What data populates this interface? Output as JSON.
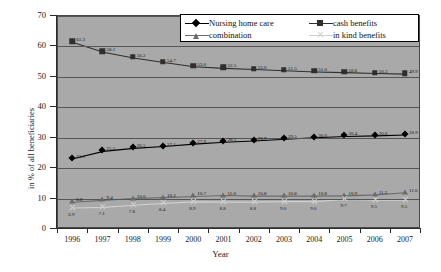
{
  "chart_data": {
    "type": "line",
    "title": "",
    "xlabel": "Year",
    "ylabel": "in % of all beneficiaries",
    "categories": [
      "1996",
      "1997",
      "1998",
      "1999",
      "2000",
      "2001",
      "2002",
      "2003",
      "2004",
      "2005",
      "2006",
      "2007"
    ],
    "ylim": [
      0,
      70
    ],
    "ytick_labels": [
      "0",
      "10",
      "20",
      "30",
      "40",
      "50",
      "60",
      "70"
    ],
    "grid": true,
    "legend_position": "top-center",
    "series": [
      {
        "name": "Nursing home care",
        "marker": "diamond",
        "color": "#000000",
        "values": [
          23.1,
          25.5,
          26.5,
          27.1,
          27.9,
          28.5,
          28.9,
          29.5,
          30.0,
          30.4,
          30.6,
          30.9
        ],
        "labels": [
          "23.1",
          "25.5",
          "26.5",
          "27.1",
          "27.9",
          "28.5",
          "28.9",
          "29.5",
          "30.0",
          "30.4",
          "30.6",
          "30.9"
        ]
      },
      {
        "name": "cash benefits",
        "marker": "square",
        "color": "#2f2f2f",
        "values": [
          61.3,
          58.1,
          56.2,
          54.7,
          53.3,
          52.8,
          52.4,
          52.0,
          51.6,
          51.4,
          51.1,
          50.9
        ],
        "labels": [
          "61.3",
          "58.1",
          "56.2",
          "54.7",
          "53.0",
          "52.5",
          "52.0",
          "51.5",
          "51.0",
          "50.6",
          "50.3",
          "49.9"
        ]
      },
      {
        "name": "combination",
        "marker": "triangle",
        "color": "#6b6b6b",
        "values": [
          8.8,
          9.4,
          10.0,
          10.3,
          10.7,
          11.0,
          10.8,
          10.8,
          10.8,
          10.9,
          11.2,
          11.9
        ],
        "labels": [
          "8.8",
          "9.4",
          "10.0",
          "10.3",
          "10.7",
          "11.0",
          "10.8",
          "10.8",
          "10.8",
          "10.9",
          "11.2",
          "11.0"
        ]
      },
      {
        "name": "in kind benefits",
        "marker": "x",
        "color": "#cfcfcf",
        "values": [
          6.9,
          7.1,
          7.8,
          8.4,
          8.9,
          8.8,
          8.8,
          9.0,
          9.0,
          9.7,
          9.5,
          9.5
        ],
        "labels": [
          "6.9",
          "7.1",
          "7.8",
          "8.4",
          "8.9",
          "8.8",
          "8.8",
          "9.0",
          "9.0",
          "9.7",
          "9.5",
          "9.5"
        ]
      }
    ]
  },
  "axes": {
    "x_title": "Year",
    "y_title": "in % of all beneficiaries"
  },
  "legend": {
    "items": [
      {
        "label": "Nursing home care",
        "marker": "diamond"
      },
      {
        "label": "cash benefits",
        "marker": "square"
      },
      {
        "label": "combination",
        "marker": "triangle"
      },
      {
        "label": "in kind benefits",
        "marker": "x"
      }
    ]
  },
  "colors": {
    "plot_background": "#a9a9a9",
    "gridline": "#555555",
    "axis": "#2b2b2b",
    "page_background": "#ffffff"
  }
}
